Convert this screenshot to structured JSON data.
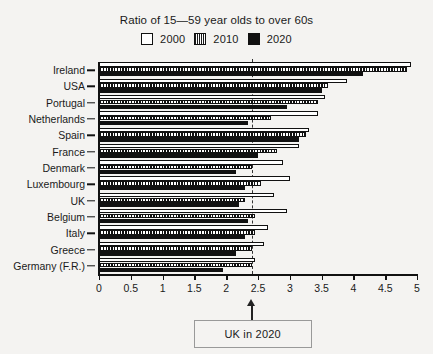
{
  "chart_data": {
    "type": "bar",
    "orientation": "horizontal",
    "title": "Ratio of 15—59 year olds to over 60s",
    "xlabel": "",
    "ylabel": "",
    "xlim": [
      0,
      5
    ],
    "xticks": [
      0,
      0.5,
      1,
      1.5,
      2,
      2.5,
      3,
      3.5,
      4,
      4.5,
      5
    ],
    "xtick_labels": [
      "0",
      "0.5",
      "1",
      "1.5",
      "2",
      "2.5",
      "3",
      "3.5",
      "4",
      "4.5",
      "5"
    ],
    "grid": false,
    "legend_position": "top-center",
    "categories": [
      "Ireland",
      "USA",
      "Portugal",
      "Netherlands",
      "Spain",
      "France",
      "Denmark",
      "Luxembourg",
      "UK",
      "Belgium",
      "Italy",
      "Greece",
      "Germany (F.R.)"
    ],
    "series": [
      {
        "name": "2000",
        "fill": "white",
        "values": [
          4.9,
          3.9,
          3.55,
          3.45,
          3.3,
          3.15,
          2.9,
          3.0,
          2.75,
          2.95,
          2.65,
          2.6,
          2.45
        ]
      },
      {
        "name": "2010",
        "fill": "hatched",
        "values": [
          4.85,
          3.6,
          3.45,
          2.7,
          3.25,
          2.8,
          2.4,
          2.55,
          2.3,
          2.45,
          2.45,
          2.4,
          2.4
        ]
      },
      {
        "name": "2020",
        "fill": "black",
        "values": [
          4.15,
          3.5,
          2.95,
          2.35,
          3.15,
          2.5,
          2.15,
          2.3,
          2.2,
          2.35,
          2.3,
          2.15,
          1.95
        ]
      }
    ],
    "annotations": [
      {
        "label": "UK in 2020",
        "x": 2.4,
        "type": "arrow-callout",
        "reference_line": true
      }
    ]
  },
  "legend": {
    "items": [
      {
        "label": "2000",
        "swatch": "empty-square-icon"
      },
      {
        "label": "2010",
        "swatch": "hatched-square-icon"
      },
      {
        "label": "2020",
        "swatch": "filled-square-icon"
      }
    ]
  }
}
